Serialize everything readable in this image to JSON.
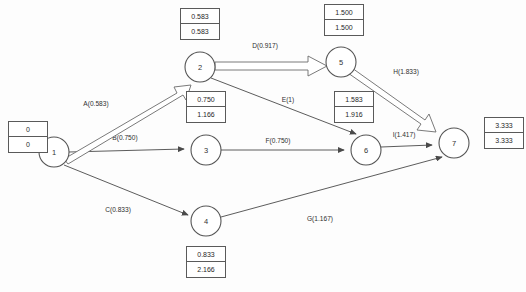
{
  "diagram": {
    "type": "activity-on-arrow-network",
    "nodes": [
      {
        "id": "1",
        "label": "1",
        "cx": 54,
        "cy": 152,
        "r": 15
      },
      {
        "id": "2",
        "label": "2",
        "cx": 200,
        "cy": 67,
        "r": 15
      },
      {
        "id": "3",
        "label": "3",
        "cx": 206,
        "cy": 150,
        "r": 15
      },
      {
        "id": "4",
        "label": "4",
        "cx": 206,
        "cy": 221,
        "r": 15
      },
      {
        "id": "5",
        "label": "5",
        "cx": 341,
        "cy": 62,
        "r": 15
      },
      {
        "id": "6",
        "label": "6",
        "cx": 366,
        "cy": 150,
        "r": 15
      },
      {
        "id": "7",
        "label": "7",
        "cx": 454,
        "cy": 143,
        "r": 15
      }
    ],
    "time_boxes": [
      {
        "node": "1",
        "earliest": "0",
        "latest": "0",
        "x": 8,
        "y": 121
      },
      {
        "node": "2",
        "earliest": "0.583",
        "latest": "0.583",
        "x": 180,
        "y": 8
      },
      {
        "node": "3",
        "earliest": "0.750",
        "latest": "1.166",
        "x": 186,
        "y": 91
      },
      {
        "node": "4",
        "earliest": "0.833",
        "latest": "2.166",
        "x": 186,
        "y": 246
      },
      {
        "node": "5",
        "earliest": "1.500",
        "latest": "1.500",
        "x": 324,
        "y": 4
      },
      {
        "node": "6",
        "earliest": "1.583",
        "latest": "1.916",
        "x": 334,
        "y": 91
      },
      {
        "node": "7",
        "earliest": "3.333",
        "latest": "3.333",
        "x": 484,
        "y": 117
      }
    ],
    "edges": [
      {
        "id": "A",
        "label": "A(0.583)",
        "from": "1",
        "to": "2",
        "duration": 0.583,
        "critical": true,
        "label_x": 96,
        "label_y": 106
      },
      {
        "id": "B",
        "label": "B(0.750)",
        "from": "1",
        "to": "3",
        "duration": 0.75,
        "critical": false,
        "label_x": 125,
        "label_y": 140
      },
      {
        "id": "C",
        "label": "C(0.833)",
        "from": "1",
        "to": "4",
        "duration": 0.833,
        "critical": false,
        "label_x": 118,
        "label_y": 212
      },
      {
        "id": "D",
        "label": "D(0.917)",
        "from": "2",
        "to": "5",
        "duration": 0.917,
        "critical": true,
        "label_x": 265,
        "label_y": 48
      },
      {
        "id": "E",
        "label": "E(1)",
        "from": "2",
        "to": "6",
        "duration": 1.0,
        "critical": false,
        "label_x": 288,
        "label_y": 102
      },
      {
        "id": "F",
        "label": "F(0.750)",
        "from": "3",
        "to": "6",
        "duration": 0.75,
        "critical": false,
        "label_x": 278,
        "label_y": 143
      },
      {
        "id": "G",
        "label": "G(1.167)",
        "from": "4",
        "to": "7",
        "duration": 1.167,
        "critical": false,
        "label_x": 320,
        "label_y": 221
      },
      {
        "id": "H",
        "label": "H(1.833)",
        "from": "5",
        "to": "7",
        "duration": 1.833,
        "critical": true,
        "label_x": 406,
        "label_y": 74
      },
      {
        "id": "I",
        "label": "I(1.417)",
        "from": "6",
        "to": "7",
        "duration": 1.417,
        "critical": false,
        "label_x": 404,
        "label_y": 137
      }
    ],
    "colors": {
      "line": "#4a4a4a",
      "critical_line": "#6b6b6b",
      "node_stroke": "#555555",
      "box_border": "#5a5a5a",
      "text": "#1f1f1f",
      "background": "#fdfdfd"
    }
  }
}
